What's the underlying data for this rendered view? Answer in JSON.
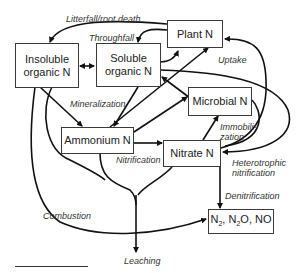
{
  "diagram": {
    "nodes": {
      "insoluble": "Insoluble organic N",
      "insoluble_line1": "Insoluble",
      "insoluble_line2": "organic N",
      "soluble_line1": "Soluble",
      "soluble_line2": "organic N",
      "plant": "Plant N",
      "microbial": "Microbial N",
      "ammonium": "Ammonium N",
      "nitrate": "Nitrate N",
      "gases": "N2, N2O, NO"
    },
    "labels": {
      "litterfall": "Litterfall/root death",
      "throughfall": "Throughfall",
      "uptake": "Uptake",
      "mineralization": "Mineralization",
      "immobilization_1": "Immobili-",
      "immobilization_2": "zation",
      "nitrification": "Nitrification",
      "heterotrophic_1": "Heterotrophic",
      "heterotrophic_2": "nitrification",
      "denitrification": "Denitrification",
      "combustion": "Combustion",
      "leaching": "Leaching"
    },
    "colors": {
      "stroke": "#111111",
      "box_border": "#3a3a3a",
      "text": "#222222"
    }
  }
}
